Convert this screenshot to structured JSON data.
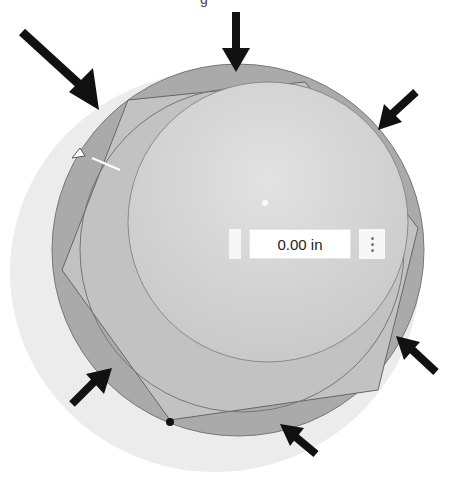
{
  "viewport": {
    "caption_fragment": "g",
    "dimension_input": {
      "value": "0.00 in"
    },
    "colors": {
      "outer_shadow": "#e6e6e6",
      "outer_ring": "#a9a9a9",
      "hex_face": "#c4c4c4",
      "dome": "#d2d2d2",
      "arrow": "#111111"
    },
    "arrows": [
      "top",
      "top-left",
      "top-right",
      "right-bottom",
      "bottom",
      "bottom-left"
    ]
  }
}
